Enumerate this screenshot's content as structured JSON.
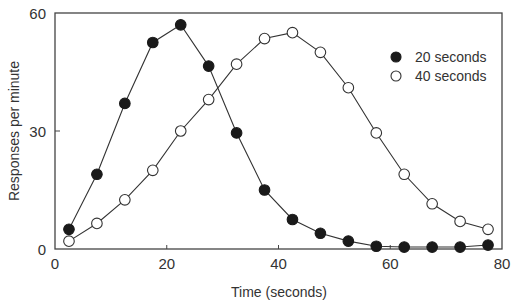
{
  "chart_data": {
    "type": "line",
    "title": "",
    "xlabel": "Time (seconds)",
    "ylabel": "Responses per minute",
    "xlim": [
      0,
      80
    ],
    "ylim": [
      0,
      60
    ],
    "x_ticks": [
      0,
      20,
      40,
      60,
      80
    ],
    "y_ticks": [
      0,
      30,
      60
    ],
    "grid": false,
    "legend_position": "upper right",
    "x": [
      2.5,
      7.5,
      12.5,
      17.5,
      22.5,
      27.5,
      32.5,
      37.5,
      42.5,
      47.5,
      52.5,
      57.5,
      62.5,
      67.5,
      72.5,
      77.5
    ],
    "series": [
      {
        "name": "20 seconds",
        "marker": "filled-circle",
        "values": [
          5,
          19,
          37,
          52.5,
          57,
          46.5,
          29.5,
          15,
          7.5,
          4,
          2,
          0.7,
          0.5,
          0.5,
          0.5,
          1
        ]
      },
      {
        "name": "40 seconds",
        "marker": "open-circle",
        "values": [
          2,
          6.5,
          12.5,
          20,
          30,
          38,
          47,
          53.5,
          55,
          50,
          41,
          29.5,
          19,
          11.5,
          7,
          5
        ]
      }
    ]
  },
  "colors": {
    "axis": "#444444",
    "line": "#333333",
    "filled_marker": "#1a1a1a",
    "open_marker_fill": "#ffffff"
  }
}
